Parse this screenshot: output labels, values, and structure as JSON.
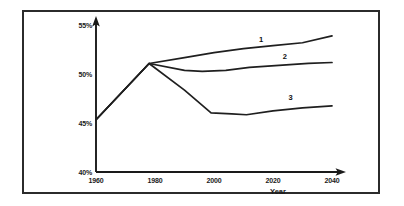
{
  "figure": {
    "background_color": "#ffffff",
    "frame_color": "#2b2b2b",
    "line_color": "#1f1f1f"
  },
  "chart_data": {
    "type": "line",
    "title": "",
    "subtitle": "",
    "xlabel": "Year",
    "ylabel": "",
    "xlim": [
      1960,
      2045
    ],
    "ylim": [
      40,
      55
    ],
    "grid": false,
    "legend_position": "inline-end-of-line",
    "x_tick_labels": [
      "1960",
      "1980",
      "2000",
      "2020",
      "2040"
    ],
    "x_ticks": [
      1960,
      1980,
      2000,
      2020,
      2040
    ],
    "y_tick_labels": [
      "40%",
      "45%",
      "50%",
      "55%"
    ],
    "y_ticks": [
      40,
      45,
      50,
      55
    ],
    "annotations": [
      {
        "text": "1",
        "x": 2016,
        "y": 53.2
      },
      {
        "text": "2",
        "x": 2024,
        "y": 51.5
      },
      {
        "text": "3",
        "x": 2026,
        "y": 47.3
      }
    ],
    "series": [
      {
        "name": "1",
        "label": "1",
        "x": [
          1960,
          1978,
          1990,
          2000,
          2010,
          2020,
          2030,
          2040
        ],
        "values": [
          45.3,
          51.0,
          51.6,
          52.1,
          52.5,
          52.8,
          53.1,
          53.8
        ]
      },
      {
        "name": "2",
        "label": "2",
        "x": [
          1960,
          1978,
          1990,
          1996,
          2004,
          2012,
          2022,
          2032,
          2040
        ],
        "values": [
          45.3,
          51.0,
          50.3,
          50.2,
          50.3,
          50.6,
          50.8,
          51.0,
          51.1
        ]
      },
      {
        "name": "3",
        "label": "3",
        "x": [
          1960,
          1978,
          1990,
          1999,
          2006,
          2011,
          2020,
          2030,
          2040
        ],
        "values": [
          45.3,
          51.0,
          48.3,
          46.0,
          45.9,
          45.8,
          46.2,
          46.5,
          46.7
        ]
      }
    ]
  }
}
